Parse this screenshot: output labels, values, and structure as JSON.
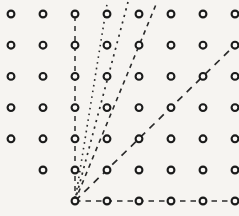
{
  "figure": {
    "width": 239,
    "height": 216,
    "background_color": "#f6f4f1",
    "ink_color": "#1b1b1b"
  },
  "chart_data": {
    "type": "scatter",
    "xlabel": "",
    "ylabel": "",
    "xlim": [
      0,
      7
    ],
    "ylim": [
      0,
      6
    ],
    "grid": false,
    "legend": "none",
    "lattice": {
      "description": "Open-circle lattice points on an 8-column by 7-row grid; points below/left of the fan of rays are omitted near the bottom-left corner.",
      "columns": 8,
      "rows": 7,
      "x_spacing_px": 32,
      "y_spacing_px": 31.2,
      "origin_px": [
        75,
        201
      ],
      "x_positions_px": [
        11,
        43,
        75,
        107,
        139,
        171,
        203,
        235
      ],
      "y_positions_px": [
        14,
        45.2,
        76.4,
        107.6,
        138.8,
        170,
        201
      ],
      "marker": "open-circle",
      "marker_radius_px": 3.4,
      "points": [
        {
          "row": 0,
          "cols": [
            0,
            1,
            2,
            3,
            4,
            5,
            6,
            7
          ]
        },
        {
          "row": 1,
          "cols": [
            0,
            1,
            2,
            3,
            4,
            5,
            6,
            7
          ]
        },
        {
          "row": 2,
          "cols": [
            0,
            1,
            2,
            3,
            4,
            5,
            6,
            7
          ]
        },
        {
          "row": 3,
          "cols": [
            0,
            1,
            2,
            3,
            4,
            5,
            6,
            7
          ]
        },
        {
          "row": 4,
          "cols": [
            0,
            1,
            2,
            3,
            4,
            5,
            6,
            7
          ]
        },
        {
          "row": 5,
          "cols": [
            1,
            2,
            3,
            4,
            5,
            6,
            7
          ]
        },
        {
          "row": 6,
          "cols": [
            2,
            3,
            4,
            5,
            6,
            7
          ]
        }
      ]
    },
    "rays": [
      {
        "name": "vertical-ray",
        "slope": "infinite",
        "style": "dashed",
        "dash_pattern": "5,5",
        "stroke_width": 1.5,
        "from_px": [
          75,
          201
        ],
        "to_px": [
          75,
          11
        ]
      },
      {
        "name": "steep-dotted-ray",
        "slope": "6:1",
        "style": "dotted",
        "dash_pattern": "1.6,4.2",
        "stroke_width": 1.6,
        "from_px": [
          75,
          201
        ],
        "to_px": [
          107,
          4
        ]
      },
      {
        "name": "dotted-ray-slope-3",
        "slope": "3:1",
        "style": "dotted",
        "dash_pattern": "2.2,4.6",
        "stroke_width": 1.7,
        "from_px": [
          75,
          201
        ],
        "to_px": [
          128,
          2
        ]
      },
      {
        "name": "dashed-ray-slope-2",
        "slope": "2:1",
        "style": "dashed",
        "dash_pattern": "4.5,4.5",
        "stroke_width": 1.6,
        "from_px": [
          75,
          201
        ],
        "to_px": [
          157,
          2
        ]
      },
      {
        "name": "diagonal-ray-slope-1",
        "slope": "1:1",
        "style": "dashed",
        "dash_pattern": "7,6",
        "stroke_width": 1.7,
        "from_px": [
          75,
          201
        ],
        "to_px": [
          235,
          45
        ]
      },
      {
        "name": "horizontal-ray",
        "slope": "0",
        "style": "dashed",
        "dash_pattern": "5.5,5",
        "stroke_width": 1.6,
        "from_px": [
          75,
          201
        ],
        "to_px": [
          239,
          201
        ]
      }
    ]
  }
}
